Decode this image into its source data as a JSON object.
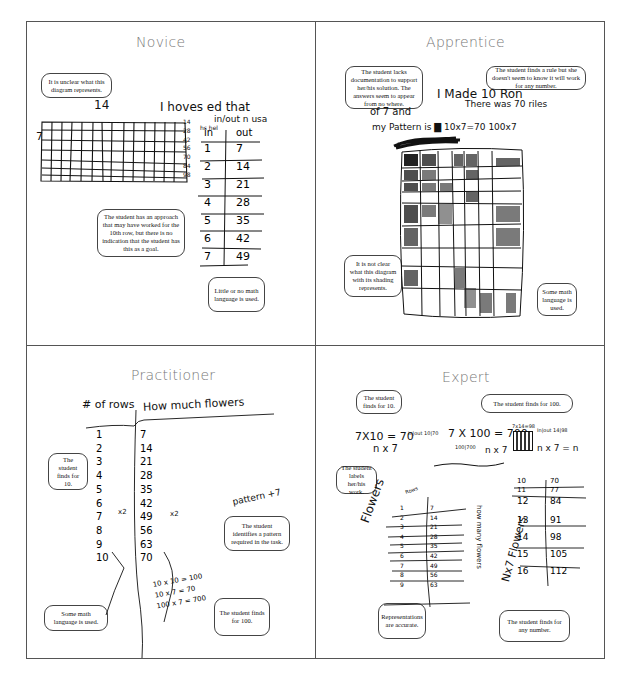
{
  "quadrants": {
    "novice": {
      "title": "Novice",
      "notes": [
        "It is unclear what this diagram represents.",
        "The student has an approach that may have worked for the 10th row, but there is no indication that the student has this as a goal.",
        "Little or no math language is used."
      ],
      "handwriting": {
        "grid_top_label": "14",
        "grid_left_label": "7",
        "grid_right_labels": [
          "14",
          "28",
          "42",
          "56",
          "70",
          "84",
          "98"
        ],
        "sentence_line1": "I hoves ed that",
        "sentence_line2": "in/out n usa",
        "sentence_line3": "hs hel",
        "table_headers": [
          "in",
          "out"
        ],
        "table_rows": [
          [
            "1",
            "7"
          ],
          [
            "2",
            "14"
          ],
          [
            "3",
            "21"
          ],
          [
            "4",
            "28"
          ],
          [
            "5",
            "35"
          ],
          [
            "6",
            "42"
          ],
          [
            "7",
            "49"
          ]
        ]
      }
    },
    "apprentice": {
      "title": "Apprentice",
      "notes": [
        "The student lacks documentation to support her/his solution. The answers seem to appear from no where.",
        "The student finds a rule but she doesn't seem to know it will work for any number.",
        "It is not clear what this diagram with its shading represents.",
        "Some math language is used."
      ],
      "handwriting": {
        "line1": "I Made 10   Ron",
        "line2a": "of 7  and",
        "line2b": "There was 70 riles",
        "line3": "my Pattern is ▇ 10x7=70 100x7"
      }
    },
    "practitioner": {
      "title": "Practitioner",
      "notes": [
        "The student finds for 10.",
        "The student identifies a pattern required in the task.",
        "Some math language is used.",
        "The student finds for 100."
      ],
      "handwriting": {
        "header_rows": "# of rows",
        "header_flowers": "How much flowers",
        "rows": [
          "1",
          "2",
          "3",
          "4",
          "5",
          "6",
          "7",
          "8",
          "9",
          "10"
        ],
        "flowers": [
          "7",
          "14",
          "21",
          "28",
          "35",
          "42",
          "49",
          "56",
          "63",
          "70"
        ],
        "x2_label": "x2",
        "pattern_label": "pattern +7",
        "equations": [
          "10 x 10 = 100",
          "10 x 7 = 70",
          "100 x 7 = 700"
        ]
      }
    },
    "expert": {
      "title": "Expert",
      "notes": [
        "The student finds for 10.",
        "The student finds for 100.",
        "The student labels her/his work.",
        "Representations are accurate.",
        "The student finds for any number."
      ],
      "handwriting": {
        "eq1": "7X10 = 70",
        "eq1b": "n x 7",
        "eq2": "7 X 100 = 700",
        "eq2b": "n x 7",
        "eq3": "7x14=98",
        "eq3b": "n x 7 = n",
        "mini_table1": "in|out 10|70",
        "mini_table2": "100|700",
        "mini_table3": "In|out 14|98",
        "side_label_left": "Flowers",
        "side_label_mid": "how many flowers",
        "side_label_right": "Nx7 Flowers",
        "rows_label": "Rows",
        "left_table": [
          [
            "1",
            "7"
          ],
          [
            "2",
            "14"
          ],
          [
            "3",
            "21"
          ],
          [
            "4",
            "28"
          ],
          [
            "5",
            "35"
          ],
          [
            "6",
            "42"
          ],
          [
            "7",
            "49"
          ],
          [
            "8",
            "56"
          ],
          [
            "9",
            "63"
          ]
        ],
        "right_table": [
          [
            "10",
            "70"
          ],
          [
            "11",
            "77"
          ],
          [
            "12",
            "84"
          ],
          [
            "13",
            "91"
          ],
          [
            "14",
            "98"
          ],
          [
            "15",
            "105"
          ],
          [
            "16",
            "112"
          ]
        ]
      }
    }
  }
}
